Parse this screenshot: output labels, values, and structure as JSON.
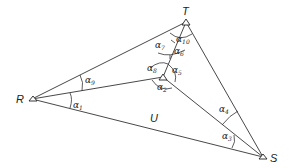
{
  "diagram": {
    "points": [
      {
        "id": "T",
        "label": "T",
        "x": 186,
        "y": 22
      },
      {
        "id": "R",
        "label": "R",
        "x": 32,
        "y": 99
      },
      {
        "id": "S",
        "label": "S",
        "x": 263,
        "y": 157
      },
      {
        "id": "P",
        "label": "",
        "x": 163,
        "y": 77
      }
    ],
    "edges": [
      {
        "from": "R",
        "to": "T"
      },
      {
        "from": "T",
        "to": "S"
      },
      {
        "from": "R",
        "to": "S",
        "label": "U"
      },
      {
        "from": "R",
        "to": "P"
      },
      {
        "from": "T",
        "to": "P"
      },
      {
        "from": "P",
        "to": "S"
      }
    ],
    "angles": [
      {
        "name": "α",
        "sub": "1"
      },
      {
        "name": "α",
        "sub": "2"
      },
      {
        "name": "α",
        "sub": "3"
      },
      {
        "name": "α",
        "sub": "4"
      },
      {
        "name": "α",
        "sub": "5"
      },
      {
        "name": "α",
        "sub": "6"
      },
      {
        "name": "α",
        "sub": "7"
      },
      {
        "name": "α",
        "sub": "8"
      },
      {
        "name": "α",
        "sub": "9"
      },
      {
        "name": "α",
        "sub": "10"
      }
    ],
    "side_label": "U"
  }
}
